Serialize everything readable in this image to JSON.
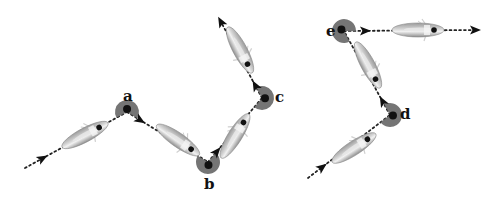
{
  "diagram": {
    "colors": {
      "path": "#222222",
      "cell_fill": "#a9a9a9",
      "cell_highlight": "#e8e8e8",
      "turn_wedge": "#6e6e6e",
      "marker": "#111111",
      "flagella": "#cfcfcf"
    },
    "turn_points": [
      {
        "id": "a",
        "label": "a",
        "x": 127,
        "y": 112,
        "label_x": 123,
        "label_y": 89
      },
      {
        "id": "b",
        "label": "b",
        "x": 208,
        "y": 162,
        "label_x": 204,
        "label_y": 177
      },
      {
        "id": "c",
        "label": "c",
        "x": 262,
        "y": 98,
        "label_x": 275,
        "label_y": 90
      },
      {
        "id": "d",
        "label": "d",
        "x": 390,
        "y": 115,
        "label_x": 400,
        "label_y": 107
      },
      {
        "id": "e",
        "label": "e",
        "x": 344,
        "y": 31,
        "label_x": 326,
        "label_y": 24
      }
    ],
    "paths": [
      {
        "name": "left-trajectory",
        "points": [
          [
            25,
            168
          ],
          [
            127,
            112
          ],
          [
            208,
            162
          ],
          [
            262,
            98
          ],
          [
            221,
            22
          ]
        ],
        "cells": [
          {
            "cx": 85,
            "cy": 135,
            "angle": -28
          },
          {
            "cx": 178,
            "cy": 140,
            "angle": 35
          },
          {
            "cx": 235,
            "cy": 136,
            "angle": -58
          },
          {
            "cx": 240,
            "cy": 50,
            "angle": 62
          }
        ]
      },
      {
        "name": "right-trajectory",
        "points": [
          [
            308,
            178
          ],
          [
            390,
            115
          ],
          [
            344,
            31
          ],
          [
            475,
            30
          ]
        ],
        "cells": [
          {
            "cx": 354,
            "cy": 148,
            "angle": -33
          },
          {
            "cx": 368,
            "cy": 65,
            "angle": 62
          },
          {
            "cx": 418,
            "cy": 30,
            "angle": 0
          }
        ]
      }
    ]
  }
}
